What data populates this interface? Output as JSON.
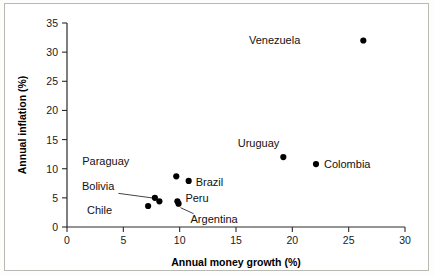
{
  "chart_data": {
    "type": "scatter",
    "title": "",
    "xlabel": "Annual money growth (%)",
    "ylabel": "Annual inflation (%)",
    "xlim": [
      0,
      30
    ],
    "ylim": [
      0,
      35
    ],
    "xticks": [
      0,
      5,
      10,
      15,
      20,
      25,
      30
    ],
    "yticks": [
      0,
      5,
      10,
      15,
      20,
      25,
      30,
      35
    ],
    "grid": false,
    "legend": "none",
    "point_color": "#000000",
    "points": [
      {
        "label": "Venezuela",
        "x": 26.3,
        "y": 32.0,
        "label_dx": -63,
        "label_dy": 4,
        "leader": false
      },
      {
        "label": "Uruguay",
        "x": 19.2,
        "y": 12.0,
        "label_dx": -4,
        "label_dy": -10,
        "leader": false
      },
      {
        "label": "Colombia",
        "x": 22.1,
        "y": 10.8,
        "label_dx": 8,
        "label_dy": 4,
        "leader": false
      },
      {
        "label": "Paraguay",
        "x": 9.7,
        "y": 8.7,
        "label_dx": -47,
        "label_dy": -11,
        "leader": false
      },
      {
        "label": "Brazil",
        "x": 10.8,
        "y": 7.9,
        "label_dx": 7,
        "label_dy": 5,
        "leader": false
      },
      {
        "label": "Peru",
        "x": 9.8,
        "y": 4.4,
        "label_dx": 8,
        "label_dy": 1,
        "leader": false
      },
      {
        "label": "Argentina",
        "x": 9.9,
        "y": 4.0,
        "label_dx": 12,
        "label_dy": 19,
        "leader": true
      },
      {
        "label": "Bolivia",
        "x": 8.2,
        "y": 4.4,
        "label_dx": -45,
        "label_dy": -11,
        "leader": true
      },
      {
        "label": "Chile",
        "x": 7.2,
        "y": 3.6,
        "label_dx": -36,
        "label_dy": 8,
        "leader": false
      },
      {
        "label": "",
        "x": 7.8,
        "y": 5.0,
        "label_dx": 0,
        "label_dy": 0,
        "leader": false
      }
    ]
  }
}
